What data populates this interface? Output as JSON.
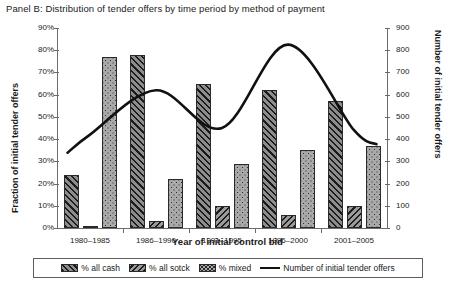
{
  "chart_data": {
    "type": "bar",
    "title": "Panel B: Distribution of tender offers by time period by method of payment",
    "xlabel": "Year of initial control bid",
    "ylabel": "Fraction of initial tender offers",
    "ylabel_right": "Number of initial tender offers",
    "categories": [
      "1980–1985",
      "1986–1990",
      "1991–1995",
      "1996–2000",
      "2001–2005"
    ],
    "ylim": [
      0,
      90
    ],
    "yticks": [
      "0%",
      "10%",
      "20%",
      "30%",
      "40%",
      "50%",
      "60%",
      "70%",
      "80%",
      "90%"
    ],
    "ylim_right": [
      0,
      900
    ],
    "yticks_right": [
      "0",
      "100",
      "200",
      "300",
      "400",
      "500",
      "600",
      "700",
      "800",
      "900"
    ],
    "grid": false,
    "legend_position": "bottom",
    "series": [
      {
        "name": "% all cash",
        "axis": "left",
        "style": "bar-hatch-forward",
        "values": [
          24,
          78,
          65,
          62,
          57
        ]
      },
      {
        "name": "% all sotck",
        "axis": "left",
        "style": "bar-hatch-backward",
        "values": [
          1,
          3,
          10,
          6,
          10
        ]
      },
      {
        "name": "% mixed",
        "axis": "left",
        "style": "bar-dotted",
        "values": [
          77,
          22,
          29,
          35,
          37
        ]
      },
      {
        "name": "Number of initial tender offers",
        "axis": "right",
        "style": "line",
        "values": [
          420,
          620,
          450,
          825,
          440
        ]
      }
    ]
  },
  "legend": {
    "items": [
      {
        "label": "% all cash",
        "swatch": "cash"
      },
      {
        "label": "% all sotck",
        "swatch": "stock"
      },
      {
        "label": "% mixed",
        "swatch": "mixed"
      },
      {
        "label": "Number of initial tender offers",
        "swatch": "line"
      }
    ]
  },
  "colors": {
    "axis": "#6b6b6b",
    "line": "#111111",
    "bar_outline": "#2a2a2a",
    "background": "#ffffff"
  }
}
